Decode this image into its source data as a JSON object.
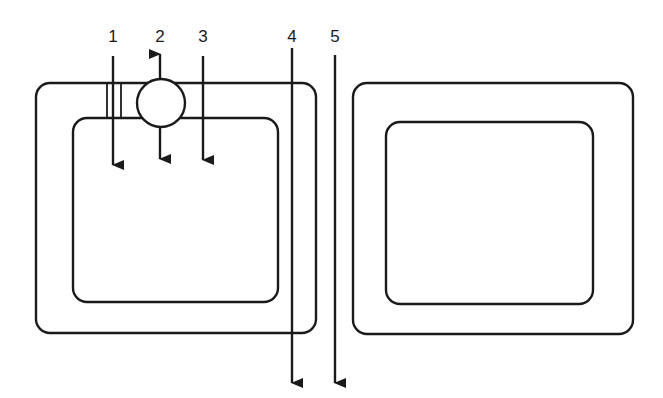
{
  "diagram": {
    "stroke_color": "#1a1a1a",
    "background": "#ffffff",
    "labels": [
      {
        "id": "1",
        "text": "1",
        "x": 113,
        "y": 42
      },
      {
        "id": "2",
        "text": "2",
        "x": 160,
        "y": 42
      },
      {
        "id": "3",
        "text": "3",
        "x": 203,
        "y": 42
      },
      {
        "id": "4",
        "text": "4",
        "x": 292,
        "y": 42
      },
      {
        "id": "5",
        "text": "5",
        "x": 335,
        "y": 42
      }
    ],
    "left_panel": {
      "outer_box": {
        "x": 36,
        "y": 83,
        "w": 280,
        "h": 250,
        "r": 14
      },
      "inner_box": {
        "x": 73,
        "y": 118,
        "w": 205,
        "h": 184,
        "r": 14
      },
      "circle": {
        "cx": 161,
        "cy": 103,
        "r": 24
      },
      "double_lines": [
        {
          "x": 107
        },
        {
          "x": 121
        }
      ]
    },
    "right_panel": {
      "outer_box": {
        "x": 353,
        "y": 83,
        "w": 280,
        "h": 251,
        "r": 14
      },
      "inner_box": {
        "x": 386,
        "y": 122,
        "w": 207,
        "h": 182,
        "r": 14
      }
    },
    "arrows": [
      {
        "id": "1",
        "x": 113,
        "y1": 56,
        "y2": 165,
        "dir": "down"
      },
      {
        "id": "2-up",
        "x": 160,
        "y1": 79,
        "y2": 54,
        "dir": "up"
      },
      {
        "id": "2-down",
        "x": 160,
        "y1": 127,
        "y2": 159,
        "dir": "down"
      },
      {
        "id": "3",
        "x": 203,
        "y1": 56,
        "y2": 160,
        "dir": "down"
      },
      {
        "id": "4",
        "x": 292,
        "y1": 48,
        "y2": 383,
        "dir": "down"
      },
      {
        "id": "5",
        "x": 335,
        "y1": 55,
        "y2": 383,
        "dir": "down"
      }
    ]
  }
}
